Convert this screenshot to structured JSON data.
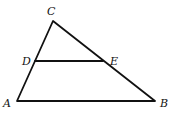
{
  "diagram": {
    "type": "triangle-with-segment",
    "colors": {
      "stroke": "#111111",
      "background": "#ffffff"
    },
    "points": {
      "A": {
        "label": "A",
        "x": 17,
        "y": 101
      },
      "B": {
        "label": "B",
        "x": 155,
        "y": 101
      },
      "C": {
        "label": "C",
        "x": 53,
        "y": 21
      },
      "D": {
        "label": "D",
        "x": 35,
        "y": 61
      },
      "E": {
        "label": "E",
        "x": 103,
        "y": 61
      }
    },
    "segments": [
      "AB",
      "BC",
      "CA",
      "DE"
    ]
  }
}
